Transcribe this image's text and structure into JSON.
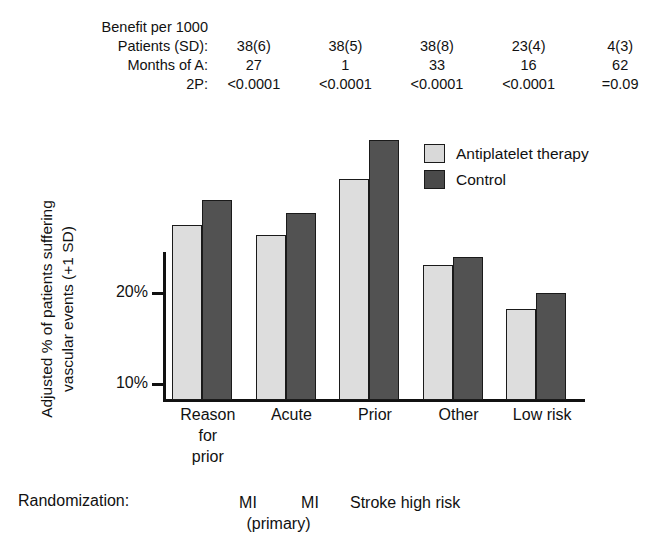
{
  "stats": {
    "row_labels": [
      "Benefit per 1000",
      "Patients (SD):",
      "Months of A:",
      "2P:"
    ],
    "columns": [
      {
        "patients_sd": "38(6)",
        "months": "27",
        "p2": "<0.0001"
      },
      {
        "patients_sd": "38(5)",
        "months": "1",
        "p2": "<0.0001"
      },
      {
        "patients_sd": "38(8)",
        "months": "33",
        "p2": "<0.0001"
      },
      {
        "patients_sd": "23(4)",
        "months": "16",
        "p2": "<0.0001"
      },
      {
        "patients_sd": "4(3)",
        "months": "62",
        "p2": "=0.09"
      }
    ]
  },
  "legend": {
    "items": [
      {
        "label": "Antiplatelet therapy",
        "color": "#d9d9d9"
      },
      {
        "label": "Control",
        "color": "#4a4a4a"
      }
    ]
  },
  "axes": {
    "y_tick_labels": [
      "20%",
      "10%"
    ],
    "y_label_line1": "Adjusted % of patients suffering",
    "y_label_line2": "vascular events (+1 SD)",
    "x_categories": [
      {
        "line1": "Reason",
        "line2": "for",
        "line3": "prior"
      },
      {
        "line1": "Acute",
        "line2": "",
        "line3": ""
      },
      {
        "line1": "Prior",
        "line2": "",
        "line3": ""
      },
      {
        "line1": "Other",
        "line2": "",
        "line3": ""
      },
      {
        "line1": "Low risk",
        "line2": "",
        "line3": ""
      }
    ]
  },
  "randomization": {
    "label": "Randomization:",
    "mi_1": "MI",
    "mi_2": "MI",
    "primary": "(primary)",
    "stroke": "Stroke high risk"
  },
  "chart_data": {
    "type": "bar",
    "title": "",
    "xlabel": "",
    "ylabel": "Adjusted % of patients suffering vascular events (+1 SD)",
    "categories": [
      "Reason for prior",
      "Acute",
      "Prior",
      "Other",
      "Low risk"
    ],
    "series": [
      {
        "name": "Antiplatelet therapy",
        "color": "#d9d9d9",
        "values": [
          20.4,
          19.3,
          25.5,
          16.0,
          11.2
        ]
      },
      {
        "name": "Control",
        "color": "#4a4a4a",
        "values": [
          23.2,
          21.8,
          29.8,
          16.9,
          13.0
        ]
      }
    ],
    "ylim": [
      0,
      32
    ],
    "yticks": [
      10,
      20
    ],
    "ytick_labels": [
      "10%",
      "20%"
    ],
    "grid": false,
    "legend_position": "top-right",
    "annotations": {
      "benefit_per_1000_patients_sd": [
        "38(6)",
        "38(5)",
        "38(8)",
        "23(4)",
        "4(3)"
      ],
      "months_of_a": [
        "27",
        "1",
        "33",
        "16",
        "62"
      ],
      "two_p": [
        "<0.0001",
        "<0.0001",
        "<0.0001",
        "<0.0001",
        "=0.09"
      ],
      "randomization": [
        "MI",
        "MI (primary)",
        "Stroke high risk"
      ]
    }
  }
}
